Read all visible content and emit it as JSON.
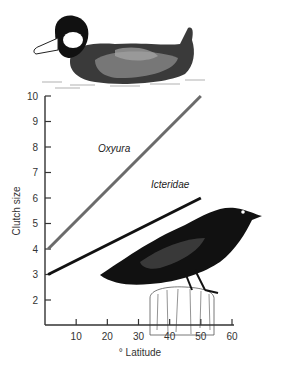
{
  "chart_data": {
    "type": "line",
    "title": "",
    "xlabel": "° Latitude",
    "ylabel": "Clutch size",
    "xlim": [
      0,
      60
    ],
    "ylim": [
      1,
      10
    ],
    "x_ticks": [
      10,
      20,
      30,
      40,
      50,
      60
    ],
    "y_ticks": [
      2,
      3,
      4,
      5,
      6,
      7,
      8,
      9,
      10
    ],
    "grid": false,
    "legend": "inline labels",
    "series": [
      {
        "name": "Oxyura",
        "color": "#6b6b6b",
        "x": [
          1,
          50
        ],
        "values": [
          4,
          10
        ]
      },
      {
        "name": "Icteridae",
        "color": "#111111",
        "x": [
          1,
          50
        ],
        "values": [
          3,
          6
        ]
      }
    ],
    "annotations": [
      {
        "text": "Oxyura",
        "x": 17,
        "y": 7.8
      },
      {
        "text": "Icteridae",
        "x": 34,
        "y": 6.4
      }
    ],
    "illustrations": [
      "ruddy-duck-drawing",
      "blackbird-on-post-drawing"
    ]
  }
}
